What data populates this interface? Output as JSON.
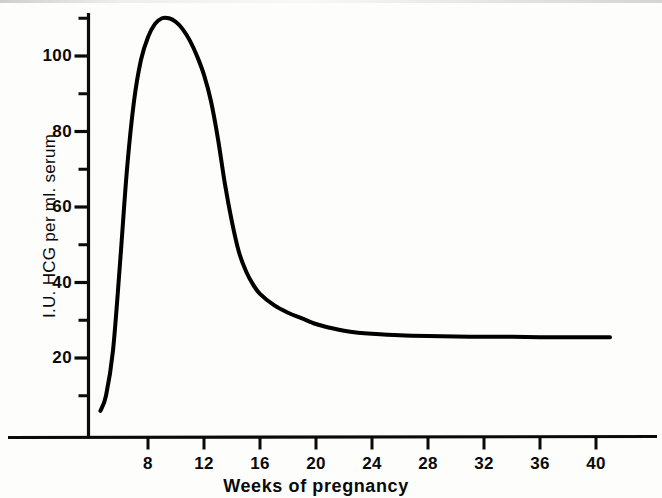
{
  "chart_data": {
    "type": "line",
    "title": "",
    "subtitle": "",
    "xlabel": "Weeks of pregnancy",
    "ylabel": "I.U. HCG per ml. serum",
    "xlim": [
      0,
      44
    ],
    "ylim": [
      0,
      115
    ],
    "grid": false,
    "legend": null,
    "annotations": [],
    "x_ticks": [
      8,
      12,
      16,
      20,
      24,
      28,
      32,
      36,
      40
    ],
    "x_tick_labels": [
      "8",
      "12",
      "16",
      "20",
      "24",
      "28",
      "32",
      "36",
      "40"
    ],
    "x_minor_ticks": [],
    "y_ticks": [
      20,
      40,
      60,
      80,
      100
    ],
    "y_tick_labels": [
      "20",
      "40",
      "60",
      "80",
      "100"
    ],
    "y_minor_ticks": [
      10,
      30,
      50,
      70,
      90,
      110
    ],
    "series": [
      {
        "name": "Serum HCG",
        "color": "#000000",
        "line_width": 4,
        "x": [
          4.6,
          5.0,
          5.5,
          6.0,
          6.5,
          7.0,
          7.5,
          8.0,
          8.5,
          9.0,
          9.5,
          10.0,
          10.5,
          11.0,
          11.5,
          12.0,
          12.5,
          13.0,
          13.5,
          14.0,
          14.5,
          15.0,
          15.5,
          16.0,
          17.0,
          18.0,
          19.0,
          20.0,
          21.0,
          22.0,
          23.0,
          24.0,
          26.0,
          28.0,
          30.0,
          32.0,
          34.0,
          36.0,
          38.0,
          40.0,
          41.0
        ],
        "y": [
          6,
          10,
          22,
          45,
          70,
          88,
          99,
          105,
          108.5,
          110,
          110,
          109,
          107,
          104,
          100,
          95,
          88,
          78,
          66,
          56,
          48,
          43,
          39.5,
          37,
          34,
          32,
          30.5,
          29,
          28,
          27.2,
          26.7,
          26.4,
          26.0,
          25.8,
          25.7,
          25.6,
          25.6,
          25.5,
          25.5,
          25.5,
          25.5
        ]
      }
    ]
  },
  "axes": {
    "y_axis_name": "y-axis",
    "x_axis_name": "x-axis"
  }
}
